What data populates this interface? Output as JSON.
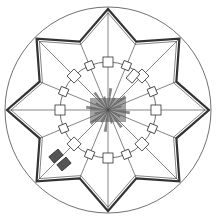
{
  "diagram": {
    "type": "architectural-plan",
    "center": [
      108,
      110
    ],
    "outer_circle_radius": 103,
    "star_points": 8,
    "star_tip_radius": 101,
    "star_inner_radius": 74,
    "inner_circle_radius": 48,
    "stroke_color": "#333333",
    "fill_dark": "#555555",
    "background": "#ffffff"
  }
}
